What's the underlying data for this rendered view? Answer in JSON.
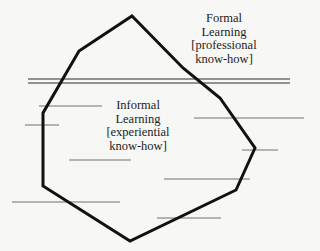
{
  "diagram": {
    "type": "iceberg-learning-model",
    "colors": {
      "background": "#f7f7f5",
      "outline": "#111111",
      "lines": "#707070",
      "text": "#1c1c1c"
    },
    "above_surface": {
      "lines": [
        "Formal",
        "Learning",
        "[professional",
        "know-how]"
      ]
    },
    "below_surface": {
      "lines": [
        "Informal",
        "Learning",
        "[experiential",
        "know-how]"
      ]
    },
    "outline_points": "132,16 183,68 220,98 255,148 236,190 130,241 43,186 43,113 79,51",
    "waterline": {
      "x1": 28,
      "x2": 290,
      "y_upper": 79,
      "y_lower": 83
    },
    "depth_lines": [
      {
        "x1": 39,
        "x2": 102,
        "y": 106
      },
      {
        "x1": 25,
        "x2": 59,
        "y": 125
      },
      {
        "x1": 194,
        "x2": 304,
        "y": 118
      },
      {
        "x1": 242,
        "x2": 278,
        "y": 150
      },
      {
        "x1": 69,
        "x2": 131,
        "y": 160
      },
      {
        "x1": 164,
        "x2": 250,
        "y": 179
      },
      {
        "x1": 12,
        "x2": 120,
        "y": 202
      },
      {
        "x1": 157,
        "x2": 221,
        "y": 218
      }
    ]
  }
}
